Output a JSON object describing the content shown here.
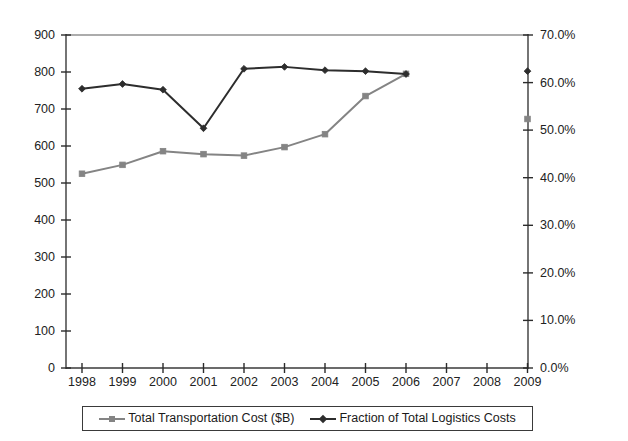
{
  "chart_data": {
    "type": "line",
    "title": "",
    "subtitle": "",
    "xlabel": "",
    "ylabel": "",
    "grid": false,
    "legend_position": "bottom",
    "x": [
      1998,
      1999,
      2000,
      2001,
      2002,
      2003,
      2004,
      2005,
      2006,
      2007,
      2008,
      2009
    ],
    "categories": [
      "1998",
      "1999",
      "2000",
      "2001",
      "2002",
      "2003",
      "2004",
      "2005",
      "2006",
      "2007",
      "2008",
      "2009"
    ],
    "axes": {
      "x": {
        "tick_labels": [
          "1998",
          "1999",
          "2000",
          "2001",
          "2002",
          "2003",
          "2004",
          "2005",
          "2006",
          "2007",
          "2008",
          "2009"
        ],
        "range": [
          1998,
          2009
        ]
      },
      "y_left": {
        "label": "",
        "tick_labels": [
          "0",
          "100",
          "200",
          "300",
          "400",
          "500",
          "600",
          "700",
          "800",
          "900"
        ],
        "ticks": [
          0,
          100,
          200,
          300,
          400,
          500,
          600,
          700,
          800,
          900
        ],
        "range": [
          0,
          900
        ],
        "unit": "$B"
      },
      "y_right": {
        "label": "",
        "tick_labels": [
          "0.0%",
          "10.0%",
          "20.0%",
          "30.0%",
          "40.0%",
          "50.0%",
          "60.0%",
          "70.0%"
        ],
        "ticks": [
          0,
          10,
          20,
          30,
          40,
          50,
          60,
          70
        ],
        "range": [
          0,
          70
        ],
        "unit": "%"
      }
    },
    "series": [
      {
        "name": "Total Transportation Cost ($B)",
        "axis": "left",
        "color": "#848484",
        "marker": "square",
        "x": [
          1998,
          1999,
          2000,
          2001,
          2002,
          2003,
          2004,
          2005,
          2006
        ],
        "values": [
          525,
          549,
          586,
          578,
          574,
          597,
          632,
          735,
          795
        ],
        "isolated_points": [
          {
            "x": 2009,
            "value": 673
          }
        ]
      },
      {
        "name": "Fraction of Total Logistics Costs",
        "axis": "right",
        "color": "#2d2d2d",
        "marker": "diamond",
        "x": [
          1998,
          1999,
          2000,
          2001,
          2002,
          2003,
          2004,
          2005,
          2006
        ],
        "values": [
          58.7,
          59.7,
          58.5,
          50.4,
          62.9,
          63.3,
          62.6,
          62.4,
          61.8
        ],
        "isolated_points": [
          {
            "x": 2009,
            "value": 62.4
          }
        ]
      }
    ],
    "legend": [
      {
        "label": "Total Transportation Cost ($B)",
        "color": "#848484",
        "marker": "square"
      },
      {
        "label": "Fraction of Total Logistics Costs",
        "color": "#2d2d2d",
        "marker": "diamond"
      }
    ]
  }
}
